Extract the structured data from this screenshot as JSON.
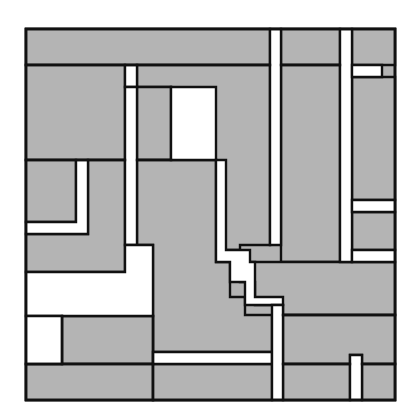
{
  "diagram": {
    "type": "abstract-grid-composition",
    "background": "#ffffff",
    "fill_color": "#b4b4b4",
    "line_color": "#111111",
    "frame": {
      "x": 26,
      "y": 29,
      "w": 369,
      "h": 371
    },
    "gray_regions": [
      {
        "id": "top-band-left",
        "points": "26,29 270,29 270,65 26,65"
      },
      {
        "id": "top-band-mid",
        "points": "281,29 340,29 340,65 281,65"
      },
      {
        "id": "upper-left-block",
        "points": "26,65 125,65 125,160 26,160"
      },
      {
        "id": "upper-center-block",
        "points": "137,65 270,65 270,245 240,245 240,250 216,250 216,160 171,160 171,87 137,87 137,65"
      },
      {
        "id": "upper-center-inner",
        "points": "137,87 171,87 171,160 137,160"
      },
      {
        "id": "right-mid-block",
        "points": "281,65 340,65 340,262 281,262 281,245"
      },
      {
        "id": "far-right-top",
        "points": "352,29 395,29 395,65 352,65"
      },
      {
        "id": "far-right-upper",
        "points": "352,77 395,77 395,200 352,200"
      },
      {
        "id": "far-right-lower",
        "points": "352,212 395,212 395,250 352,250"
      },
      {
        "id": "left-l-inner",
        "points": "26,160 76,160 76,222 26,222"
      },
      {
        "id": "left-mid-block",
        "points": "88,160 125,160 125,272 26,272 26,234 88,234"
      },
      {
        "id": "center-tall-block",
        "points": "137,160 216,160 216,262 230,262 230,297 245,297 245,315 272,315 272,352 153,352 153,245 137,245"
      },
      {
        "id": "right-lower-band",
        "points": "240,262 281,262 281,262 395,262 395,315 283,315 283,305 255,305 255,282 240,282"
      },
      {
        "id": "bottom-left-mid",
        "points": "62,316 153,316 153,364 62,364"
      },
      {
        "id": "bottom-right-block",
        "points": "283,315 395,315 395,364 362,364 362,355 350,355 350,364 283,364"
      },
      {
        "id": "bottom-row-left",
        "points": "26,364 153,364 153,400 26,400"
      },
      {
        "id": "bottom-row-mid",
        "points": "153,364 272,364 272,400 153,400"
      },
      {
        "id": "bottom-row-right",
        "points": "283,364 350,364 350,400 283,400"
      },
      {
        "id": "bottom-row-far-right",
        "points": "362,364 395,364 395,400 362,400"
      }
    ],
    "white_regions": [
      {
        "id": "top-small-slot",
        "points": "125,65 137,65 137,87 125,87"
      },
      {
        "id": "tall-white-window",
        "points": "171,87 216,87 216,160 171,160"
      },
      {
        "id": "left-strip",
        "points": "125,87 137,87 137,245 125,245"
      },
      {
        "id": "left-l-gap",
        "points": "76,160 88,160 88,234 26,234 26,222 76,222"
      },
      {
        "id": "large-white-l",
        "points": "26,272 125,272 125,245 153,245 153,316 26,316"
      },
      {
        "id": "small-white-box",
        "points": "26,316 62,316 62,364 26,364"
      },
      {
        "id": "staircase-path",
        "points": "216,160 226,160 226,250 250,250 250,262 255,262 255,297 283,297 283,305 245,305 245,282 230,282 230,262 216,262"
      },
      {
        "id": "vertical-strip-mid",
        "points": "270,29 281,29 281,245 270,245"
      },
      {
        "id": "vertical-strip-right",
        "points": "340,29 352,29 352,262 340,262"
      },
      {
        "id": "right-stub-top",
        "points": "352,65 382,65 382,77 352,77"
      },
      {
        "id": "right-stub-mid",
        "points": "352,200 395,200 395,212 352,212"
      },
      {
        "id": "right-stub-low",
        "points": "352,250 395,250 395,262 352,262"
      },
      {
        "id": "bottom-horizontal-strip",
        "points": "153,352 272,352 272,364 153,364"
      },
      {
        "id": "bottom-vertical-strip",
        "points": "272,305 283,305 283,400 272,400"
      },
      {
        "id": "bottom-small-post",
        "points": "350,355 362,355 362,400 350,400"
      }
    ]
  }
}
